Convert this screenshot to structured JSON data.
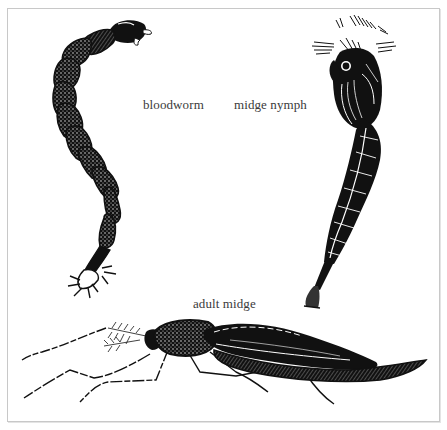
{
  "figure": {
    "border_color": "#c8c8c8",
    "ink_color": "#111111",
    "labels": [
      {
        "id": "bloodworm",
        "text": "bloodworm"
      },
      {
        "id": "midge-nymph",
        "text": "midge nymph"
      },
      {
        "id": "adult-midge",
        "text": "adult midge"
      }
    ],
    "specimens": [
      {
        "name": "bloodworm",
        "stage": "larva"
      },
      {
        "name": "midge nymph",
        "stage": "pupa"
      },
      {
        "name": "adult midge",
        "stage": "adult"
      }
    ]
  }
}
